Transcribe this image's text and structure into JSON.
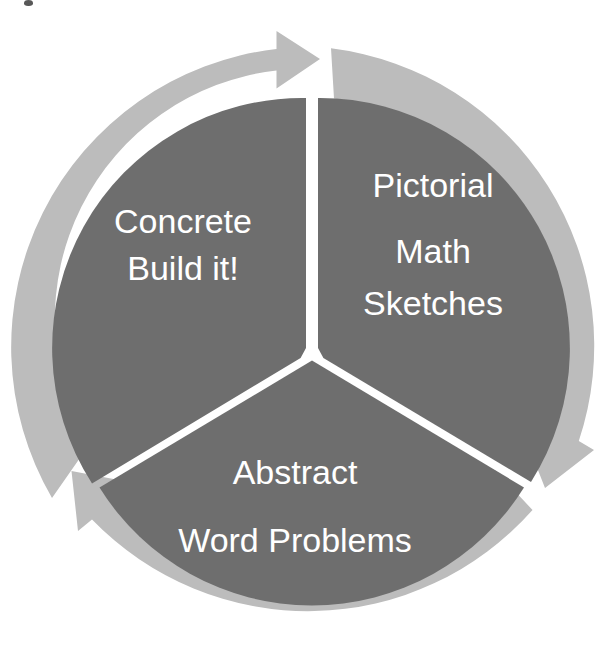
{
  "diagram": {
    "name": "concrete-pictorial-abstract-cycle",
    "type": "three-segment-cycle",
    "direction": "clockwise",
    "colors": {
      "segment_fill": "#6e6e6e",
      "ring_arrow": "#bcbcbc",
      "divider": "#ffffff",
      "label_text": "#ffffff",
      "background": "#ffffff"
    },
    "geometry": {
      "center_x": 312,
      "center_y": 348,
      "outer_radius": 300,
      "inner_radius": 250,
      "segment_count": 3
    },
    "segments": [
      {
        "id": "concrete",
        "position": "upper-left",
        "lines": [
          "Concrete",
          "Build it!"
        ]
      },
      {
        "id": "pictorial",
        "position": "upper-right",
        "lines": [
          "Pictorial",
          "Math",
          "Sketches"
        ]
      },
      {
        "id": "abstract",
        "position": "bottom",
        "lines": [
          "Abstract",
          "Word Problems"
        ]
      }
    ],
    "arrows": [
      {
        "id": "arrow-top",
        "name": "clockwise-arrow-top",
        "points_to": "pictorial"
      },
      {
        "id": "arrow-right",
        "name": "clockwise-arrow-right",
        "points_to": "abstract"
      },
      {
        "id": "arrow-left",
        "name": "clockwise-arrow-left",
        "points_to": "concrete"
      }
    ]
  },
  "labels": {
    "concrete_line1": "Concrete",
    "concrete_line2": "Build it!",
    "pictorial_line1": "Pictorial",
    "pictorial_line2": "Math",
    "pictorial_line3": "Sketches",
    "abstract_line1": "Abstract",
    "abstract_line2": "Word Problems"
  }
}
